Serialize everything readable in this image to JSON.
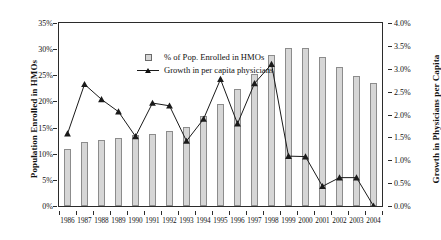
{
  "chart_data": {
    "type": "bar",
    "title": "",
    "subtitle": "",
    "xlabel": "",
    "ylabel": "Population Enrolled in HMOs",
    "y2label": "Growth in Physicians per Capita",
    "grid": false,
    "legend_position": "top-left",
    "categories": [
      "1986",
      "1987",
      "1988",
      "1989",
      "1990",
      "1991",
      "1992",
      "1993",
      "1994",
      "1995",
      "1996",
      "1997",
      "1998",
      "1999",
      "2000",
      "2001",
      "2002",
      "2003",
      "2004"
    ],
    "ylim": [
      0,
      35
    ],
    "y2lim": [
      0,
      4.0
    ],
    "yticks": [
      "0%",
      "5%",
      "10%",
      "15%",
      "20%",
      "25%",
      "30%",
      "35%"
    ],
    "ytick_values": [
      0,
      5,
      10,
      15,
      20,
      25,
      30,
      35
    ],
    "y2ticks": [
      "0.0%",
      "0.5%",
      "1.0%",
      "1.5%",
      "2.0%",
      "2.5%",
      "3.0%",
      "3.5%",
      "4.0%"
    ],
    "y2tick_values": [
      0,
      0.5,
      1.0,
      1.5,
      2.0,
      2.5,
      3.0,
      3.5,
      4.0
    ],
    "series": [
      {
        "name": "% of Pop. Enrolled in HMOs",
        "kind": "bar",
        "axis": "left",
        "color": "#d6d6d6",
        "edge_color": "#8c8c8c",
        "values": [
          10.9,
          12.2,
          12.7,
          13.1,
          13.5,
          13.7,
          14.4,
          15.1,
          17.2,
          19.6,
          22.4,
          25.3,
          28.8,
          30.3,
          30.2,
          28.5,
          26.5,
          24.8,
          23.6
        ]
      },
      {
        "name": "Growth in per capita physicians",
        "kind": "line",
        "axis": "right",
        "color": "#1a1a1a",
        "marker": "triangle",
        "values": [
          1.58,
          2.66,
          2.33,
          2.06,
          1.52,
          2.25,
          2.19,
          1.42,
          1.9,
          2.77,
          1.8,
          2.68,
          3.1,
          1.09,
          1.08,
          0.43,
          0.62,
          0.62,
          0.0
        ]
      }
    ]
  },
  "legend": {
    "items": [
      {
        "label": "% of Pop. Enrolled in HMOs",
        "key": "square-swatch"
      },
      {
        "label": "Growth in per capita physicians",
        "key": "line-triangle-marker"
      }
    ]
  },
  "axes": {
    "left_title": "Population Enrolled in HMOs",
    "right_title": "Growth in Physicians per Capita"
  }
}
